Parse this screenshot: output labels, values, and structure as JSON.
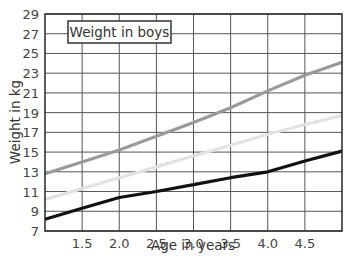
{
  "chart_data": {
    "type": "line",
    "title": "Weight in boys",
    "xlabel": "Age in years",
    "ylabel": "Weight in kg",
    "x": [
      1.0,
      1.5,
      2.0,
      2.5,
      3.0,
      3.5,
      4.0,
      4.5,
      5.0
    ],
    "xticks": [
      "1.5",
      "2.0",
      "2.5",
      "3.0",
      "3.5",
      "4.0",
      "4.5"
    ],
    "xlim": [
      1.0,
      5.0
    ],
    "yticks": [
      "7",
      "9",
      "11",
      "13",
      "15",
      "17",
      "19",
      "21",
      "23",
      "25",
      "27",
      "29"
    ],
    "ylim": [
      7,
      29
    ],
    "grid": true,
    "legend": null,
    "series": [
      {
        "name": "upper (dark gray)",
        "color": "#9a9a9a",
        "values": [
          12.8,
          14.0,
          15.2,
          16.6,
          18.0,
          19.5,
          21.2,
          22.8,
          24.1
        ]
      },
      {
        "name": "middle (light gray)",
        "color": "#e2e2e2",
        "values": [
          10.2,
          11.3,
          12.4,
          13.5,
          14.6,
          15.7,
          16.8,
          17.8,
          18.7
        ]
      },
      {
        "name": "lower (black)",
        "color": "#111111",
        "values": [
          8.2,
          9.3,
          10.4,
          11.0,
          11.7,
          12.4,
          13.0,
          14.1,
          15.1
        ]
      }
    ]
  },
  "chart": {
    "title": "Weight in boys",
    "xlabel": "Age in years",
    "ylabel": "Weight in kg"
  }
}
